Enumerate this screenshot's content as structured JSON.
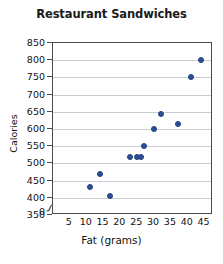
{
  "chart_data": {
    "type": "scatter",
    "title": "Restaurant Sandwiches",
    "xlabel": "Fat (grams)",
    "ylabel": "Calories",
    "xlim": [
      0,
      47.5
    ],
    "ylim": [
      350,
      850
    ],
    "y_axis_break": true,
    "y_zero_label": "0",
    "grid": true,
    "legend": "none",
    "xticks": [
      5,
      10,
      15,
      20,
      25,
      30,
      35,
      40,
      45
    ],
    "yticks": [
      350,
      400,
      450,
      500,
      550,
      600,
      650,
      700,
      750,
      800,
      850
    ],
    "points": [
      {
        "x": 11,
        "y": 430
      },
      {
        "x": 14,
        "y": 470
      },
      {
        "x": 17,
        "y": 405
      },
      {
        "x": 23,
        "y": 520
      },
      {
        "x": 25,
        "y": 520
      },
      {
        "x": 26,
        "y": 520
      },
      {
        "x": 27,
        "y": 550
      },
      {
        "x": 30,
        "y": 600
      },
      {
        "x": 32,
        "y": 645
      },
      {
        "x": 37,
        "y": 615
      },
      {
        "x": 41,
        "y": 750
      },
      {
        "x": 44,
        "y": 800
      }
    ],
    "marker_color": "#2d4f95",
    "gridline_color": "#c9cdd4",
    "frame_color": "#4a4a4a"
  }
}
